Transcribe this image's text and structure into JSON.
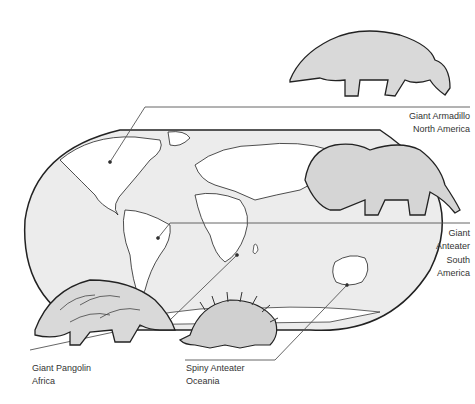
{
  "colors": {
    "map_fill": "#ececec",
    "land_fill": "#ffffff",
    "outline": "#222222",
    "animal_fill": "#d9d9d9",
    "leader_line": "#555555",
    "text": "#333333"
  },
  "labels": {
    "armadillo": {
      "species": "Giant Armadillo",
      "region": "North America"
    },
    "anteater": {
      "species_line1": "Giant",
      "species_line2": "Anteater",
      "region_line1": "South",
      "region_line2": "America"
    },
    "pangolin": {
      "species": "Giant Pangolin",
      "region": "Africa"
    },
    "echidna": {
      "species": "Spiny Anteater",
      "region": "Oceania"
    }
  }
}
